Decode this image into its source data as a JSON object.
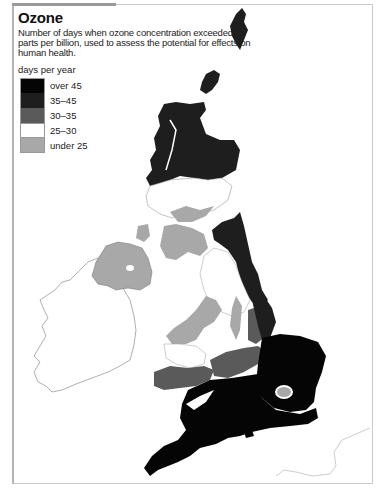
{
  "title": "Ozone",
  "description": "Number of days when ozone concentration exceeded 50 parts per billion, used to assess the potential for effects on human health.",
  "legend": {
    "title": "days per year",
    "items": [
      {
        "label": "over 45",
        "color": "#050505"
      },
      {
        "label": "35–45",
        "color": "#1e1e1e"
      },
      {
        "label": "30–35",
        "color": "#5a5a5a"
      },
      {
        "label": "25–30",
        "color": "#ffffff"
      },
      {
        "label": "under 25",
        "color": "#a8a8a8"
      }
    ]
  },
  "map": {
    "region": "Great Britain and Ireland",
    "colors": {
      "over_45": "#050505",
      "c35_45": "#1e1e1e",
      "c30_35": "#5a5a5a",
      "c25_30": "#ffffff",
      "under_25": "#a8a8a8",
      "outline": "#9a9a9a"
    }
  }
}
